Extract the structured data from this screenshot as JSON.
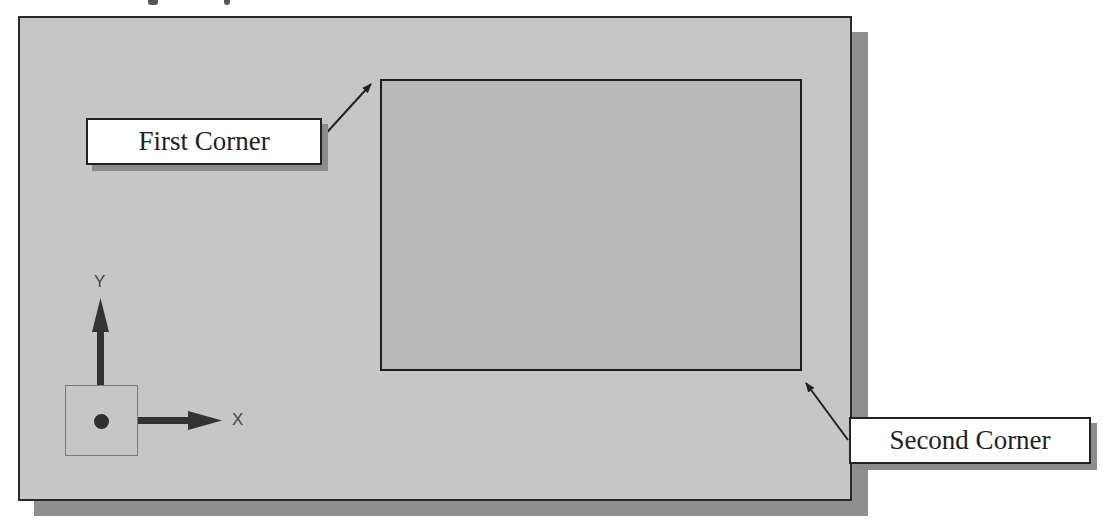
{
  "figure": {
    "panel_color": "#c6c6c6",
    "rectangle_color": "#b9b9b9",
    "shadow_color": "#8f8f8f",
    "callouts": {
      "first_corner": "First Corner",
      "second_corner": "Second Corner"
    },
    "ucs_icon": {
      "y_label": "Y",
      "x_label": "X"
    }
  }
}
